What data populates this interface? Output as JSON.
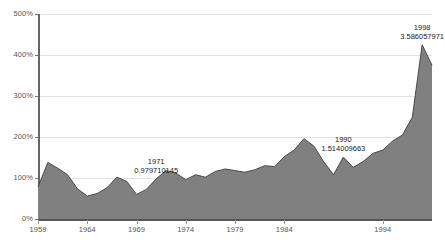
{
  "chart_data": {
    "type": "area",
    "title": "",
    "xlabel": "",
    "ylabel": "",
    "ylim": [
      0,
      500
    ],
    "yunit": "%",
    "grid": true,
    "legend": "none",
    "series_color": "#808080",
    "line_color": "#4a4a4a",
    "ytick_labels": [
      "0%",
      "100%",
      "200%",
      "300%",
      "400%",
      "500%"
    ],
    "ytick_values": [
      0,
      100,
      200,
      300,
      400,
      500
    ],
    "xtick_labels": [
      "1959",
      "1964",
      "1969",
      "1974",
      "1979",
      "1984",
      "1994"
    ],
    "xtick_values": [
      1959,
      1964,
      1969,
      1974,
      1979,
      1984,
      1994
    ],
    "xlim": [
      1959,
      1999
    ],
    "x": [
      1959,
      1960,
      1961,
      1962,
      1963,
      1964,
      1965,
      1966,
      1967,
      1968,
      1969,
      1970,
      1971,
      1972,
      1973,
      1974,
      1975,
      1976,
      1977,
      1978,
      1979,
      1980,
      1981,
      1982,
      1983,
      1984,
      1985,
      1986,
      1987,
      1988,
      1989,
      1990,
      1991,
      1992,
      1993,
      1994,
      1995,
      1996,
      1997,
      1998,
      1999
    ],
    "values": [
      78,
      138,
      124,
      108,
      74,
      56,
      62,
      76,
      102,
      92,
      60,
      72,
      98,
      118,
      112,
      96,
      108,
      102,
      116,
      122,
      118,
      114,
      120,
      130,
      128,
      152,
      168,
      196,
      178,
      140,
      108,
      151,
      126,
      140,
      160,
      168,
      190,
      205,
      248,
      425,
      375
    ],
    "annotations": [
      {
        "year": "1971",
        "value": "0.979710145",
        "x": 1971,
        "y": 98
      },
      {
        "year": "1990",
        "value": "1.514009663",
        "x": 1990,
        "y": 151
      },
      {
        "year": "1998",
        "value": "3.586057971",
        "x": 1998,
        "y": 425
      }
    ]
  }
}
